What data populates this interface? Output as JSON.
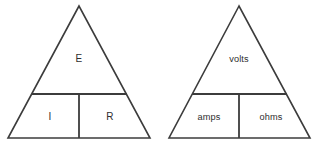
{
  "diagram": {
    "background_color": "#ffffff",
    "line_color": "#3c3c3c",
    "text_color": "#2e2e2e",
    "triangles": [
      {
        "id": "symbols",
        "name": "ohms-law-triangle-symbols",
        "apex": {
          "x": 79,
          "y": 6
        },
        "base_left": {
          "x": 8,
          "y": 138
        },
        "base_right": {
          "x": 150,
          "y": 138
        },
        "divider_y": 94,
        "divider_x": 79,
        "top_cell": {
          "label": "E",
          "text_x": 79,
          "text_y": 59
        },
        "bottom_left_cell": {
          "label": "I",
          "text_x": 50,
          "text_y": 117
        },
        "bottom_right_cell": {
          "label": "R",
          "text_x": 110,
          "text_y": 117
        }
      },
      {
        "id": "units",
        "name": "ohms-law-triangle-units",
        "apex": {
          "x": 239,
          "y": 6
        },
        "base_left": {
          "x": 169,
          "y": 138
        },
        "base_right": {
          "x": 310,
          "y": 138
        },
        "divider_y": 94,
        "divider_x": 239,
        "top_cell": {
          "label": "volts",
          "text_x": 239,
          "text_y": 60
        },
        "bottom_left_cell": {
          "label": "amps",
          "text_x": 209,
          "text_y": 118
        },
        "bottom_right_cell": {
          "label": "ohms",
          "text_x": 271,
          "text_y": 118
        }
      }
    ]
  }
}
